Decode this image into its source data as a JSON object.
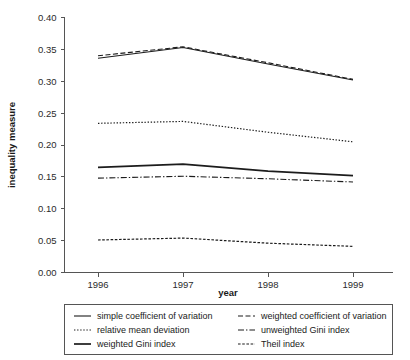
{
  "chart_data": {
    "type": "line",
    "title": "",
    "xlabel": "year",
    "ylabel": "inequality measure",
    "x": [
      1996,
      1997,
      1998,
      1999
    ],
    "xtick_labels": [
      "1996",
      "1997",
      "1998",
      "1999"
    ],
    "ytick_labels": [
      "0.00",
      "0.05",
      "0.10",
      "0.15",
      "0.20",
      "0.25",
      "0.30",
      "0.35",
      "0.40"
    ],
    "ytick_values": [
      0.0,
      0.05,
      0.1,
      0.15,
      0.2,
      0.25,
      0.3,
      0.35,
      0.4
    ],
    "xlim": [
      1996,
      1999
    ],
    "ylim": [
      0.0,
      0.4
    ],
    "grid": false,
    "legend_position": "below-axes",
    "series": [
      {
        "name": "simple coefficient of variation",
        "values": [
          0.336,
          0.353,
          0.327,
          0.302
        ],
        "style": "solid",
        "width": 1.1,
        "color": "#1c1c1c"
      },
      {
        "name": "weighted coefficient of variation",
        "values": [
          0.34,
          0.354,
          0.329,
          0.303
        ],
        "style": "dashed",
        "width": 1.1,
        "color": "#1c1c1c"
      },
      {
        "name": "relative mean deviation",
        "values": [
          0.234,
          0.237,
          0.22,
          0.205
        ],
        "style": "dotted",
        "width": 1.2,
        "color": "#1c1c1c"
      },
      {
        "name": "unweighted Gini index",
        "values": [
          0.148,
          0.151,
          0.147,
          0.142
        ],
        "style": "dashdot",
        "width": 1.1,
        "color": "#1c1c1c"
      },
      {
        "name": "weighted Gini index",
        "values": [
          0.165,
          0.17,
          0.159,
          0.152
        ],
        "style": "solid-thick",
        "width": 1.7,
        "color": "#3a3a3a"
      },
      {
        "name": "Theil index",
        "values": [
          0.051,
          0.054,
          0.046,
          0.041
        ],
        "style": "fine-dashed",
        "width": 1.2,
        "color": "#1c1c1c"
      }
    ]
  },
  "legend": {
    "entries": [
      {
        "label": "simple coefficient of variation",
        "style": "solid"
      },
      {
        "label": "weighted coefficient of variation",
        "style": "dashed"
      },
      {
        "label": "relative mean deviation",
        "style": "dotted"
      },
      {
        "label": "unweighted Gini index",
        "style": "dashdot"
      },
      {
        "label": "weighted Gini index",
        "style": "solid-thick"
      },
      {
        "label": "Theil index",
        "style": "fine-dashed"
      }
    ]
  },
  "axes": {
    "x_title": "year",
    "y_title": "inequality measure"
  }
}
